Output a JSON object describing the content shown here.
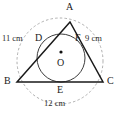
{
  "figure": {
    "background_color": "#ffffff",
    "stroke_color": "#1a1a1a",
    "dashed_stroke_color": "#9a9a9a",
    "circle_stroke_color": "#4a4a4a",
    "width": 123,
    "height": 119
  },
  "points": {
    "A": {
      "label": "A",
      "x": 70,
      "y": 22
    },
    "B": {
      "label": "B",
      "x": 17,
      "y": 82
    },
    "C": {
      "label": "C",
      "x": 103,
      "y": 82
    },
    "D": {
      "label": "D",
      "x": 45,
      "y": 45
    },
    "E": {
      "label": "E",
      "x": 61,
      "y": 82
    },
    "F": {
      "label": "F",
      "x": 82,
      "y": 45
    },
    "O": {
      "label": "O",
      "x": 61,
      "y": 57
    }
  },
  "measurements": {
    "side_AB": "11 cm",
    "side_AC": "9 cm",
    "side_BC": "12 cm"
  },
  "incircle": {
    "center_x": 61,
    "center_y": 58,
    "radius": 24
  },
  "circumcircle": {
    "center_x": 60,
    "center_y": 61,
    "radius": 43,
    "style": "dashed"
  }
}
